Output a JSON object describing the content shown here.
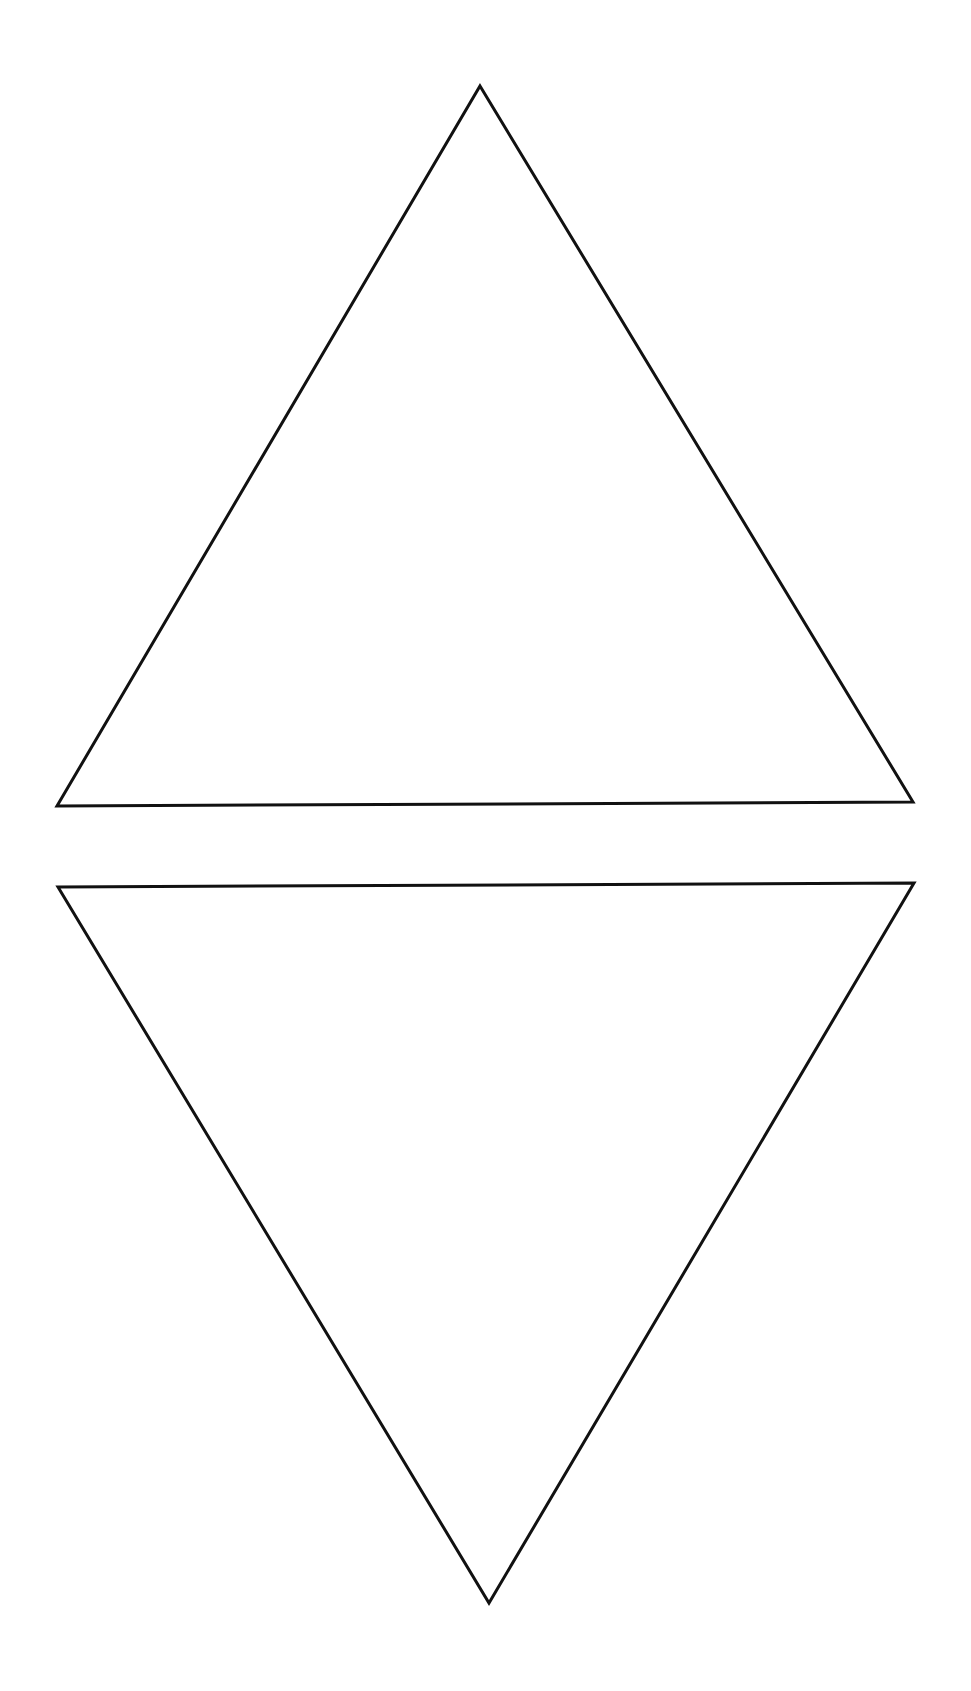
{
  "canvas": {
    "width": 971,
    "height": 1691,
    "background": "#ffffff"
  },
  "style": {
    "stroke": "#111111",
    "stroke_width": 3,
    "fill": "none"
  },
  "shapes": [
    {
      "name": "upward-triangle",
      "points": "480,86 913,802 57,806"
    },
    {
      "name": "downward-triangle",
      "points": "58,887 914,883 489,1603"
    }
  ]
}
